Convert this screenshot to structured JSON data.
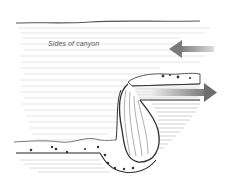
{
  "diagram": {
    "labels": {
      "canyon_sides": "Sides of canyon"
    },
    "arrows": [
      {
        "name": "inflow-arrow",
        "direction": "left",
        "color": "#8a8a8a"
      },
      {
        "name": "outflow-arrow",
        "direction": "right",
        "color": "#8a8a8a"
      }
    ],
    "colors": {
      "background": "#ffffff",
      "line": "#333333",
      "hatch": "#c8c8c8",
      "dots": "#333333"
    }
  }
}
